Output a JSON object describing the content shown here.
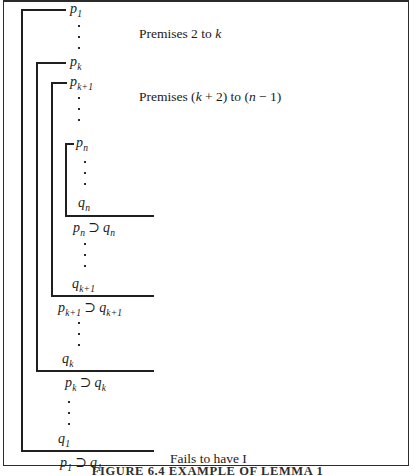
{
  "figure": {
    "caption": "FIGURE 6.4  EXAMPLE OF LEMMA 1",
    "annotations": {
      "premises_outer": "Premises 2 to k",
      "premises_inner": "Premises (k + 2) to (n − 1)",
      "fails": "Fails to have I"
    },
    "symbols": {
      "horseshoe": "⊃"
    },
    "levels": [
      {
        "name": "level-1",
        "premise": {
          "base": "p",
          "sub": "1"
        },
        "conclusion_left": {
          "base": "p",
          "sub": "1"
        },
        "conclusion_right": {
          "base": "q",
          "sub": "1"
        },
        "closing": {
          "base": "q",
          "sub": "1"
        }
      },
      {
        "name": "level-2",
        "premise": {
          "base": "p",
          "sub": "k"
        },
        "conclusion_left": {
          "base": "p",
          "sub": "k"
        },
        "conclusion_right": {
          "base": "q",
          "sub": "k"
        },
        "closing": {
          "base": "q",
          "sub": "k"
        }
      },
      {
        "name": "level-3",
        "premise": {
          "base": "p",
          "sub": "k+1"
        },
        "conclusion_left": {
          "base": "p",
          "sub": "k+1"
        },
        "conclusion_right": {
          "base": "q",
          "sub": "k+1"
        },
        "closing": {
          "base": "q",
          "sub": "k+1"
        }
      },
      {
        "name": "level-4",
        "premise": {
          "base": "p",
          "sub": "n"
        },
        "conclusion_left": {
          "base": "p",
          "sub": "n"
        },
        "conclusion_right": {
          "base": "q",
          "sub": "n"
        },
        "closing": {
          "base": "q",
          "sub": "n"
        }
      }
    ]
  }
}
